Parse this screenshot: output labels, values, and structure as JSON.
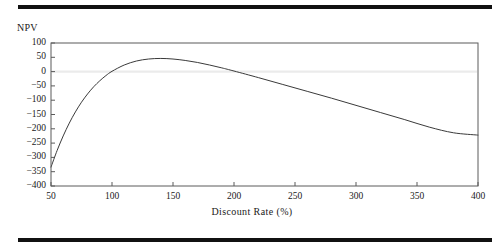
{
  "figure": {
    "rule_color": "#111111",
    "background": "#ffffff"
  },
  "chart_data": {
    "type": "line",
    "title": "",
    "xlabel": "Discount Rate (%)",
    "ylabel": "NPV",
    "xlim": [
      50,
      400
    ],
    "ylim": [
      -400,
      100
    ],
    "xticks": [
      50,
      100,
      150,
      200,
      250,
      300,
      350,
      400
    ],
    "yticks": [
      100,
      50,
      0,
      -50,
      -100,
      -150,
      -200,
      -250,
      -300,
      -350,
      -400
    ],
    "xtick_labels": [
      "50",
      "100",
      "150",
      "200",
      "250",
      "300",
      "350",
      "400"
    ],
    "ytick_labels": [
      "100",
      "50",
      "0",
      "−50",
      "−100",
      "−150",
      "−200",
      "−250",
      "−300",
      "−350",
      "−400"
    ],
    "grid": false,
    "zero_line": true,
    "zero_line_color": "#ebebeb",
    "legend": "none",
    "line_color": "#3a3a3a",
    "line_width": 1,
    "series": [
      {
        "name": "NPV",
        "x": [
          50,
          55,
          60,
          65,
          70,
          75,
          80,
          85,
          90,
          95,
          100,
          110,
          120,
          130,
          140,
          150,
          160,
          170,
          180,
          190,
          200,
          220,
          240,
          260,
          280,
          300,
          320,
          340,
          360,
          380,
          400
        ],
        "values": [
          -334,
          -276,
          -225,
          -180,
          -141,
          -107,
          -78,
          -53,
          -32,
          -14,
          1,
          23,
          37,
          44,
          46,
          44,
          39,
          32,
          23,
          13,
          2,
          -21,
          -45,
          -69,
          -93,
          -118,
          -143,
          -168,
          -194,
          -214,
          -222
        ]
      }
    ],
    "annotations": {
      "zero_crossings": [
        95,
        197
      ],
      "peak_x": 140,
      "peak_y": 46,
      "start_value": -334,
      "end_value": -222
    }
  },
  "axes": {
    "y_title": "NPV",
    "x_title": "Discount Rate (%)"
  }
}
